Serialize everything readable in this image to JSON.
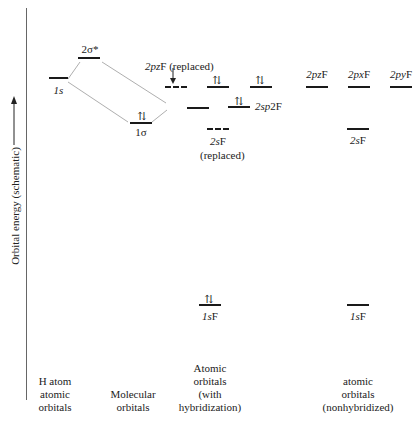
{
  "axis": {
    "label": "Orbital energy (schematic)",
    "arrow": "up-arrow"
  },
  "columns": [
    {
      "id": "h-atom",
      "label_lines": [
        "H atom",
        "atomic",
        "orbitals"
      ]
    },
    {
      "id": "molecular",
      "label_lines": [
        "Molecular",
        "orbitals"
      ]
    },
    {
      "id": "hybridized",
      "label_lines": [
        "Atomic",
        "orbitals",
        "(with",
        "hybridization)"
      ]
    },
    {
      "id": "nonhybridized",
      "label_lines": [
        "atomic",
        "orbitals",
        "(nonhybridized)"
      ]
    }
  ],
  "levels": {
    "h_1s": {
      "label": "1s"
    },
    "sigma_star": {
      "label": "2σ*"
    },
    "sigma": {
      "label": "1σ",
      "electrons": "⇅"
    },
    "pz_replaced": {
      "label": "2pzF (replaced)",
      "style": "dashed"
    },
    "hyb_upper_1": {
      "electrons": "⇅"
    },
    "hyb_upper_2": {
      "electrons": "⇅"
    },
    "hyb_bonding": {
      "label": ""
    },
    "sp2": {
      "label": "2sp2F",
      "electrons": "⇅"
    },
    "s_replaced": {
      "label_lines": [
        "2sF",
        "(replaced)"
      ],
      "style": "dashed"
    },
    "hyb_1s": {
      "label": "1sF",
      "electrons": "⇅"
    },
    "nh_2pz": {
      "label": "2pzF"
    },
    "nh_2px": {
      "label": "2pxF"
    },
    "nh_2py": {
      "label": "2pyF"
    },
    "nh_2s": {
      "label": "2sF"
    },
    "nh_1s": {
      "label": "1sF"
    }
  }
}
